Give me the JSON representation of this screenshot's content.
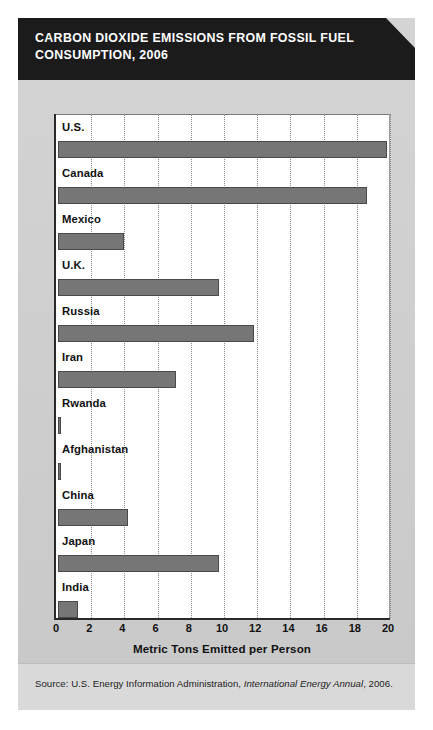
{
  "figure": {
    "title": "CARBON DIOXIDE EMISSIONS FROM FOSSIL FUEL CONSUMPTION, 2006",
    "source_prefix": "Source: U.S. Energy Information Administration, ",
    "source_italic": "International Energy Annual",
    "source_suffix": ", 2006.",
    "accent_dark": "#1b1b1b",
    "bar_fill": "#767676",
    "bar_stroke": "#4a4a4a",
    "panel_bg": "#cfcfcf",
    "plot_bg": "#ffffff"
  },
  "chart_data": {
    "type": "bar",
    "orientation": "horizontal",
    "title": "Carbon Dioxide Emissions from Fossil Fuel Consumption, 2006",
    "xlabel": "Metric Tons Emitted per Person",
    "ylabel": "",
    "xlim": [
      0,
      20
    ],
    "xticks": [
      0,
      2,
      4,
      6,
      8,
      10,
      12,
      14,
      16,
      18,
      20
    ],
    "grid": "vertical-dotted",
    "legend": "none",
    "categories": [
      "U.S.",
      "Canada",
      "Mexico",
      "U.K.",
      "Russia",
      "Iran",
      "Rwanda",
      "Afghanistan",
      "China",
      "Japan",
      "India"
    ],
    "values": [
      19.8,
      18.6,
      4.0,
      9.7,
      11.8,
      7.1,
      0.1,
      0.1,
      4.2,
      9.7,
      1.2
    ],
    "units": "metric tons CO2 per person"
  }
}
